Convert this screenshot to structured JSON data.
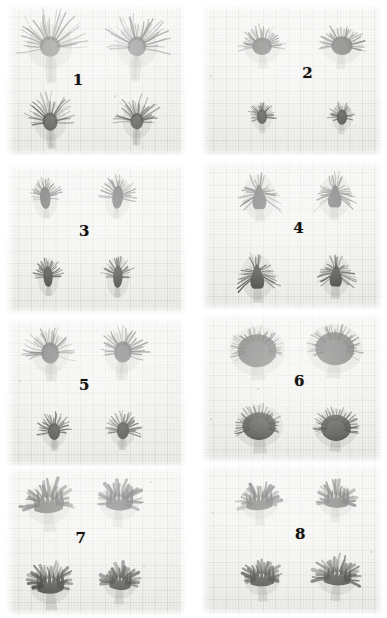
{
  "plate": {
    "title": "Specimen comparison plate",
    "background_color": "#ffffff",
    "panel_ground_color": "#f6f5f2",
    "ink_color": "#15130f",
    "columns": 2,
    "rows": 4,
    "panel_count": 8,
    "specimens_per_panel": 4
  },
  "panels": [
    {
      "number": "1",
      "label": "1",
      "column": 0,
      "row": 0,
      "x": 6,
      "y": 4,
      "w": 180,
      "h": 152,
      "number_x": 0.4,
      "number_y": 0.5,
      "number_size": 15,
      "form": "fountain",
      "description": "long fine radiating filaments, pale elongated translucent stem",
      "specimens": [
        {
          "cx": 0.245,
          "cy": 0.27,
          "scale": 1.04,
          "rot": -2,
          "rays": 34,
          "ray_len": 25,
          "head_w": 17,
          "head_h": 17,
          "stem_w": 9,
          "stem_h": 26,
          "dark": 0.62
        },
        {
          "cx": 0.73,
          "cy": 0.27,
          "scale": 1.0,
          "rot": 3,
          "rays": 32,
          "ray_len": 24,
          "head_w": 16,
          "head_h": 17,
          "stem_w": 9,
          "stem_h": 25,
          "dark": 0.64
        },
        {
          "cx": 0.245,
          "cy": 0.76,
          "scale": 0.92,
          "rot": -3,
          "rays": 30,
          "ray_len": 21,
          "head_w": 14,
          "head_h": 17,
          "stem_w": 8,
          "stem_h": 20,
          "dark": 0.78
        },
        {
          "cx": 0.73,
          "cy": 0.76,
          "scale": 0.88,
          "rot": 2,
          "rays": 29,
          "ray_len": 20,
          "head_w": 13,
          "head_h": 16,
          "stem_w": 8,
          "stem_h": 19,
          "dark": 0.78
        }
      ],
      "specks": [
        {
          "x": 0.6,
          "y": 0.6,
          "r": 1.2
        }
      ]
    },
    {
      "number": "2",
      "label": "2",
      "column": 1,
      "row": 0,
      "x": 201,
      "y": 4,
      "w": 182,
      "h": 152,
      "number_x": 0.585,
      "number_y": 0.455,
      "number_size": 15,
      "form": "compact-spiky",
      "description": "compact dark spiky heads with short pale stems",
      "specimens": [
        {
          "cx": 0.335,
          "cy": 0.27,
          "scale": 1.0,
          "rot": -2,
          "rays": 30,
          "ray_len": 14,
          "head_w": 17,
          "head_h": 15,
          "stem_w": 8,
          "stem_h": 14,
          "dark": 0.86
        },
        {
          "cx": 0.775,
          "cy": 0.26,
          "scale": 1.02,
          "rot": 3,
          "rays": 31,
          "ray_len": 14,
          "head_w": 18,
          "head_h": 16,
          "stem_w": 8,
          "stem_h": 14,
          "dark": 0.88
        },
        {
          "cx": 0.335,
          "cy": 0.745,
          "scale": 0.8,
          "rot": -1,
          "rays": 26,
          "ray_len": 11,
          "head_w": 11,
          "head_h": 16,
          "stem_w": 7,
          "stem_h": 12,
          "dark": 0.88
        },
        {
          "cx": 0.775,
          "cy": 0.745,
          "scale": 0.82,
          "rot": 2,
          "rays": 26,
          "ray_len": 11,
          "head_w": 11,
          "head_h": 16,
          "stem_w": 7,
          "stem_h": 12,
          "dark": 0.88
        }
      ],
      "specks": [
        {
          "x": 0.05,
          "y": 0.47,
          "r": 1.0
        }
      ]
    },
    {
      "number": "3",
      "label": "3",
      "column": 0,
      "row": 1,
      "x": 6,
      "y": 164,
      "w": 180,
      "h": 150,
      "number_x": 0.435,
      "number_y": 0.445,
      "number_size": 15,
      "form": "narrow-spindle",
      "description": "narrow elongated dark spindles with sparse bristles, faint stem",
      "specimens": [
        {
          "cx": 0.215,
          "cy": 0.2,
          "scale": 0.95,
          "rot": -4,
          "rays": 24,
          "ray_len": 12,
          "head_w": 11,
          "head_h": 21,
          "stem_w": 6,
          "stem_h": 10,
          "dark": 0.92
        },
        {
          "cx": 0.62,
          "cy": 0.19,
          "scale": 0.98,
          "rot": 5,
          "rays": 25,
          "ray_len": 13,
          "head_w": 11,
          "head_h": 21,
          "stem_w": 6,
          "stem_h": 10,
          "dark": 0.92
        },
        {
          "cx": 0.235,
          "cy": 0.735,
          "scale": 0.92,
          "rot": -2,
          "rays": 23,
          "ray_len": 11,
          "head_w": 10,
          "head_h": 20,
          "stem_w": 6,
          "stem_h": 10,
          "dark": 0.93
        },
        {
          "cx": 0.62,
          "cy": 0.725,
          "scale": 0.95,
          "rot": 2,
          "rays": 24,
          "ray_len": 12,
          "head_w": 10,
          "head_h": 21,
          "stem_w": 6,
          "stem_h": 10,
          "dark": 0.93
        }
      ],
      "specks": []
    },
    {
      "number": "4",
      "label": "4",
      "column": 1,
      "row": 1,
      "x": 201,
      "y": 160,
      "w": 182,
      "h": 150,
      "number_x": 0.535,
      "number_y": 0.455,
      "number_size": 15,
      "form": "conical-bristled",
      "description": "conical dark heads fringed with downswept bristles, pale blocky stem",
      "specimens": [
        {
          "cx": 0.32,
          "cy": 0.22,
          "scale": 1.0,
          "rot": -2,
          "rays": 28,
          "ray_len": 15,
          "head_w": 14,
          "head_h": 21,
          "stem_w": 9,
          "stem_h": 13,
          "dark": 0.9
        },
        {
          "cx": 0.735,
          "cy": 0.22,
          "scale": 0.98,
          "rot": 2,
          "rays": 27,
          "ray_len": 15,
          "head_w": 14,
          "head_h": 20,
          "stem_w": 9,
          "stem_h": 13,
          "dark": 0.9
        },
        {
          "cx": 0.31,
          "cy": 0.755,
          "scale": 1.0,
          "rot": -2,
          "rays": 28,
          "ray_len": 15,
          "head_w": 14,
          "head_h": 21,
          "stem_w": 9,
          "stem_h": 14,
          "dark": 0.9
        },
        {
          "cx": 0.74,
          "cy": 0.75,
          "scale": 0.96,
          "rot": 2,
          "rays": 27,
          "ray_len": 14,
          "head_w": 13,
          "head_h": 20,
          "stem_w": 9,
          "stem_h": 13,
          "dark": 0.9
        }
      ],
      "specks": []
    },
    {
      "number": "5",
      "label": "5",
      "column": 0,
      "row": 2,
      "x": 6,
      "y": 318,
      "w": 180,
      "h": 150,
      "number_x": 0.435,
      "number_y": 0.445,
      "number_size": 15,
      "form": "plume-bulb",
      "description": "plumed dark heads on distinct pale bulbous stems",
      "specimens": [
        {
          "cx": 0.245,
          "cy": 0.22,
          "scale": 1.02,
          "rot": -3,
          "rays": 30,
          "ray_len": 18,
          "head_w": 15,
          "head_h": 18,
          "stem_w": 10,
          "stem_h": 18,
          "dark": 0.84
        },
        {
          "cx": 0.65,
          "cy": 0.21,
          "scale": 1.02,
          "rot": 3,
          "rays": 30,
          "ray_len": 18,
          "head_w": 15,
          "head_h": 18,
          "stem_w": 10,
          "stem_h": 18,
          "dark": 0.84
        },
        {
          "cx": 0.265,
          "cy": 0.745,
          "scale": 0.86,
          "rot": -2,
          "rays": 27,
          "ray_len": 14,
          "head_w": 12,
          "head_h": 17,
          "stem_w": 8,
          "stem_h": 13,
          "dark": 0.88
        },
        {
          "cx": 0.65,
          "cy": 0.74,
          "scale": 0.88,
          "rot": 2,
          "rays": 27,
          "ray_len": 14,
          "head_w": 12,
          "head_h": 17,
          "stem_w": 8,
          "stem_h": 13,
          "dark": 0.88
        }
      ],
      "specks": [
        {
          "x": 0.07,
          "y": 0.41,
          "r": 1.1
        }
      ]
    },
    {
      "number": "6",
      "label": "6",
      "column": 1,
      "row": 2,
      "x": 201,
      "y": 313,
      "w": 182,
      "h": 150,
      "number_x": 0.54,
      "number_y": 0.45,
      "number_size": 15,
      "form": "globose-dense",
      "description": "large dense globose dark heads, short pale trapezoid stems",
      "specimens": [
        {
          "cx": 0.31,
          "cy": 0.23,
          "scale": 1.18,
          "rot": -2,
          "rays": 38,
          "ray_len": 12,
          "head_w": 23,
          "head_h": 20,
          "stem_w": 11,
          "stem_h": 14,
          "dark": 0.8
        },
        {
          "cx": 0.735,
          "cy": 0.22,
          "scale": 1.18,
          "rot": 3,
          "rays": 38,
          "ray_len": 12,
          "head_w": 23,
          "head_h": 20,
          "stem_w": 11,
          "stem_h": 14,
          "dark": 0.8
        },
        {
          "cx": 0.32,
          "cy": 0.745,
          "scale": 1.1,
          "rot": -2,
          "rays": 36,
          "ray_len": 12,
          "head_w": 21,
          "head_h": 18,
          "stem_w": 11,
          "stem_h": 15,
          "dark": 0.82
        },
        {
          "cx": 0.74,
          "cy": 0.755,
          "scale": 1.04,
          "rot": 2,
          "rays": 35,
          "ray_len": 12,
          "head_w": 20,
          "head_h": 18,
          "stem_w": 10,
          "stem_h": 13,
          "dark": 0.82
        }
      ],
      "specks": [
        {
          "x": 0.31,
          "y": 0.5,
          "r": 1.2
        },
        {
          "x": 0.05,
          "y": 0.7,
          "r": 1.0
        }
      ]
    },
    {
      "number": "7",
      "label": "7",
      "column": 0,
      "row": 3,
      "x": 6,
      "y": 466,
      "w": 180,
      "h": 150,
      "number_x": 0.415,
      "number_y": 0.48,
      "number_size": 15,
      "form": "broad-lobed",
      "description": "broad dark lobed heads with splayed blade-like tips, pale stem",
      "specimens": [
        {
          "cx": 0.235,
          "cy": 0.24,
          "scale": 1.06,
          "rot": -4,
          "rays": 22,
          "ray_len": 16,
          "head_w": 19,
          "head_h": 17,
          "stem_w": 10,
          "stem_h": 17,
          "dark": 0.82
        },
        {
          "cx": 0.63,
          "cy": 0.23,
          "scale": 1.0,
          "rot": 3,
          "rays": 21,
          "ray_len": 15,
          "head_w": 18,
          "head_h": 16,
          "stem_w": 9,
          "stem_h": 16,
          "dark": 0.84
        },
        {
          "cx": 0.245,
          "cy": 0.78,
          "scale": 1.02,
          "rot": -3,
          "rays": 22,
          "ray_len": 15,
          "head_w": 18,
          "head_h": 17,
          "stem_w": 10,
          "stem_h": 16,
          "dark": 0.84
        },
        {
          "cx": 0.635,
          "cy": 0.775,
          "scale": 0.92,
          "rot": 3,
          "rays": 20,
          "ray_len": 14,
          "head_w": 16,
          "head_h": 16,
          "stem_w": 9,
          "stem_h": 15,
          "dark": 0.84
        }
      ],
      "specks": [
        {
          "x": 0.8,
          "y": 0.1,
          "r": 1.2
        },
        {
          "x": 0.76,
          "y": 0.66,
          "r": 1.0
        }
      ]
    },
    {
      "number": "8",
      "label": "8",
      "column": 1,
      "row": 3,
      "x": 201,
      "y": 463,
      "w": 182,
      "h": 152,
      "number_x": 0.545,
      "number_y": 0.47,
      "number_size": 15,
      "form": "crown-lobed",
      "description": "dark crown-like heads with pointed lobes, narrow pale stem",
      "specimens": [
        {
          "cx": 0.32,
          "cy": 0.255,
          "scale": 1.0,
          "rot": -3,
          "rays": 20,
          "ray_len": 13,
          "head_w": 18,
          "head_h": 15,
          "stem_w": 9,
          "stem_h": 15,
          "dark": 0.86
        },
        {
          "cx": 0.74,
          "cy": 0.245,
          "scale": 0.98,
          "rot": 3,
          "rays": 20,
          "ray_len": 13,
          "head_w": 17,
          "head_h": 15,
          "stem_w": 9,
          "stem_h": 14,
          "dark": 0.86
        },
        {
          "cx": 0.335,
          "cy": 0.76,
          "scale": 0.98,
          "rot": -2,
          "rays": 21,
          "ray_len": 13,
          "head_w": 17,
          "head_h": 15,
          "stem_w": 9,
          "stem_h": 15,
          "dark": 0.86
        },
        {
          "cx": 0.745,
          "cy": 0.745,
          "scale": 1.02,
          "rot": 4,
          "rays": 24,
          "ray_len": 15,
          "head_w": 18,
          "head_h": 15,
          "stem_w": 9,
          "stem_h": 15,
          "dark": 0.84
        }
      ],
      "specks": [
        {
          "x": 0.06,
          "y": 0.32,
          "r": 1.0
        },
        {
          "x": 0.93,
          "y": 0.58,
          "r": 1.1
        }
      ]
    }
  ]
}
